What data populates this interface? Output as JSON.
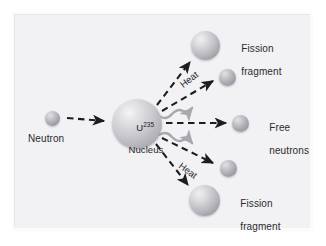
{
  "figure": {
    "background_color": "#ffffff",
    "panel_color": "#f2f1f4",
    "frame_color": "#e6e5e9",
    "ink_color": "#2b2b2e",
    "sphere_color": "#b9b8be",
    "arrow_color": "#1d1d20",
    "heat_arrow_color": "#a9a8b0"
  },
  "nodes": {
    "incoming_neutron": {
      "label": "Neutron",
      "kind": "small-sphere",
      "cx": 52,
      "cy": 118,
      "d": 15
    },
    "nucleus": {
      "label_line1_base": "U",
      "label_line1_sup": "235",
      "label_line2": "Nucleus",
      "kind": "large-sphere",
      "cx": 137,
      "cy": 124,
      "d": 50
    },
    "fission_fragment_top": {
      "label_line1": "Fission",
      "label_line2": "fragment",
      "kind": "medium-sphere",
      "cx": 205,
      "cy": 45,
      "d": 29
    },
    "neutron_top": {
      "label": "",
      "kind": "small-sphere",
      "cx": 227,
      "cy": 77,
      "d": 17
    },
    "free_neutrons": {
      "label_line1": "Free",
      "label_line2": "neutrons",
      "kind": "small-sphere",
      "cx": 240,
      "cy": 123,
      "d": 17
    },
    "neutron_bottom": {
      "label": "",
      "kind": "small-sphere",
      "cx": 228,
      "cy": 168,
      "d": 17
    },
    "fission_fragment_bottom": {
      "label_line1": "Fission",
      "label_line2": "fragment",
      "kind": "medium-sphere",
      "cx": 204,
      "cy": 200,
      "d": 31
    }
  },
  "annotations": {
    "heat_top": "Heat",
    "heat_bottom": "Heat"
  },
  "arrows": [
    {
      "name": "neutron-to-nucleus",
      "style": "dashed",
      "from": [
        67,
        118
      ],
      "to": [
        108,
        122
      ]
    },
    {
      "name": "nucleus-to-fission-fragment-top",
      "style": "dashed",
      "from": [
        157,
        104
      ],
      "to": [
        192,
        60
      ]
    },
    {
      "name": "nucleus-to-neutron-top",
      "style": "dashed",
      "from": [
        163,
        110
      ],
      "to": [
        216,
        80
      ]
    },
    {
      "name": "nucleus-to-free-neutrons",
      "style": "dashed",
      "from": [
        166,
        123
      ],
      "to": [
        229,
        123
      ]
    },
    {
      "name": "nucleus-to-neutron-bottom",
      "style": "dashed",
      "from": [
        163,
        139
      ],
      "to": [
        216,
        164
      ]
    },
    {
      "name": "nucleus-to-fission-fragment-bottom",
      "style": "dashed",
      "from": [
        156,
        145
      ],
      "to": [
        190,
        187
      ]
    },
    {
      "name": "heat-arrow-top",
      "style": "wavy",
      "from": [
        152,
        116
      ],
      "to": [
        196,
        88
      ]
    },
    {
      "name": "heat-arrow-bottom",
      "style": "wavy",
      "from": [
        152,
        134
      ],
      "to": [
        196,
        161
      ]
    }
  ]
}
